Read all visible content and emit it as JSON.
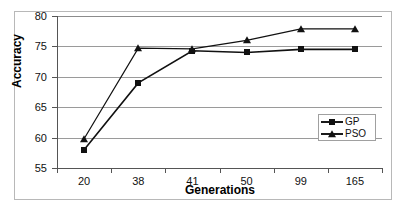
{
  "chart_data": {
    "type": "line",
    "title": "",
    "xlabel": "Generations",
    "ylabel": "Accuracy",
    "categories": [
      "20",
      "38",
      "41",
      "50",
      "99",
      "165"
    ],
    "yticks": [
      "55",
      "60",
      "65",
      "70",
      "75",
      "80"
    ],
    "ylim": [
      55,
      80
    ],
    "grid": true,
    "legend_position": "center-right",
    "series": [
      {
        "name": "GP",
        "marker": "square",
        "color": "#111111",
        "values": [
          58.0,
          69.0,
          74.3,
          74.0,
          74.5,
          74.5
        ]
      },
      {
        "name": "PSO",
        "marker": "triangle",
        "color": "#111111",
        "values": [
          59.8,
          74.7,
          74.6,
          76.0,
          77.9,
          77.9
        ]
      }
    ]
  },
  "legend": {
    "entries": [
      {
        "label": "GP"
      },
      {
        "label": "PSO"
      }
    ]
  },
  "axes": {
    "y_title": "Accuracy",
    "x_title": "Generations"
  },
  "colors": {
    "gridline": "#9a9a9a",
    "axis": "#555555",
    "series": "#111111",
    "frame": "#b8b8b8",
    "background": "#ffffff"
  }
}
